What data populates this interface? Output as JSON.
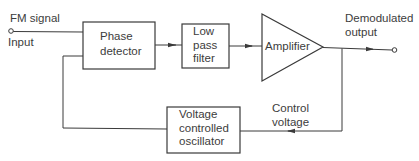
{
  "diagram": {
    "type": "block-diagram",
    "colors": {
      "line": "#3a3a3a",
      "background": "#ffffff"
    },
    "input": {
      "label_top": "FM signal",
      "label_bottom": "Input"
    },
    "blocks": [
      {
        "id": "phase_detector",
        "line1": "Phase",
        "line2": "detector"
      },
      {
        "id": "low_pass_filter",
        "line1": "Low",
        "line2": "pass",
        "line3": "filter"
      },
      {
        "id": "amplifier",
        "label": "Amplifier",
        "shape": "triangle"
      },
      {
        "id": "vco",
        "line1": "Voltage",
        "line2": "controlled",
        "line3": "oscillator"
      }
    ],
    "output": {
      "line1": "Demodulated",
      "line2": "output"
    },
    "feedback": {
      "line1": "Control",
      "line2": "voltage"
    },
    "connections": [
      {
        "from": "input",
        "to": "phase_detector"
      },
      {
        "from": "phase_detector",
        "to": "low_pass_filter"
      },
      {
        "from": "low_pass_filter",
        "to": "amplifier"
      },
      {
        "from": "amplifier",
        "to": "output"
      },
      {
        "from": "amplifier",
        "to": "vco",
        "label": "Control voltage"
      },
      {
        "from": "vco",
        "to": "phase_detector"
      }
    ]
  }
}
